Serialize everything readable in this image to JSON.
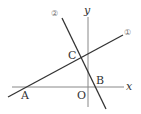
{
  "diagram": {
    "type": "coordinate-plane",
    "axes": {
      "x_label": "x",
      "y_label": "y",
      "origin_label": "O"
    },
    "lines": [
      {
        "id": "line-1",
        "label": "①"
      },
      {
        "id": "line-2",
        "label": "②"
      }
    ],
    "points": [
      {
        "name": "A",
        "label": "A",
        "description": "intersection of line ① with x-axis"
      },
      {
        "name": "B",
        "label": "B",
        "description": "intersection of line ② with x-axis"
      },
      {
        "name": "C",
        "label": "C",
        "description": "intersection of lines ① and ②"
      }
    ],
    "colors": {
      "axis": "#888888",
      "line": "#333333",
      "text": "#333333"
    }
  }
}
